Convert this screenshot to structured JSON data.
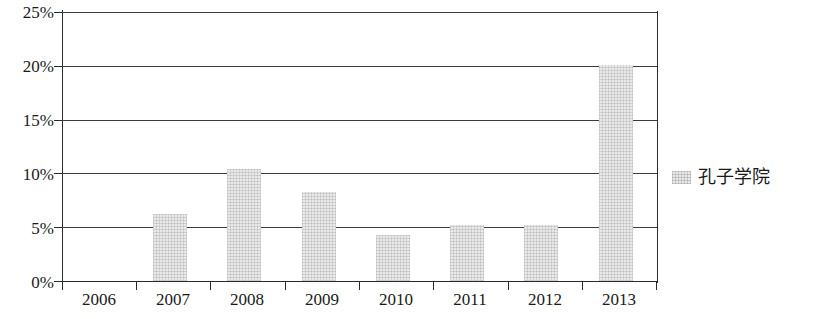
{
  "chart_data": {
    "type": "bar",
    "title": "",
    "subtitle": "",
    "xlabel": "",
    "ylabel": "",
    "categories": [
      "2006",
      "2007",
      "2008",
      "2009",
      "2010",
      "2011",
      "2012",
      "2013"
    ],
    "values": [
      0,
      6.2,
      10.4,
      8.3,
      4.3,
      5.2,
      5.2,
      20.1
    ],
    "series": [
      {
        "name": "孔子学院",
        "values": [
          0,
          6.2,
          10.4,
          8.3,
          4.3,
          5.2,
          5.2,
          20.1
        ],
        "color": "#e9e9e9"
      }
    ],
    "ylim": [
      0,
      25
    ],
    "ytick_labels": [
      "0%",
      "5%",
      "10%",
      "15%",
      "20%",
      "25%"
    ],
    "ytick_values": [
      0,
      5,
      10,
      15,
      20,
      25
    ],
    "grid": true,
    "grid_axis": "y",
    "legend": {
      "position": "right",
      "entries": [
        {
          "label": "孔子学院",
          "swatch_color": "#e9e9e9"
        }
      ]
    },
    "annotations": [],
    "axis_color": "#2a2a2a",
    "background": "#ffffff"
  },
  "legend": {
    "label": "孔子学院"
  }
}
